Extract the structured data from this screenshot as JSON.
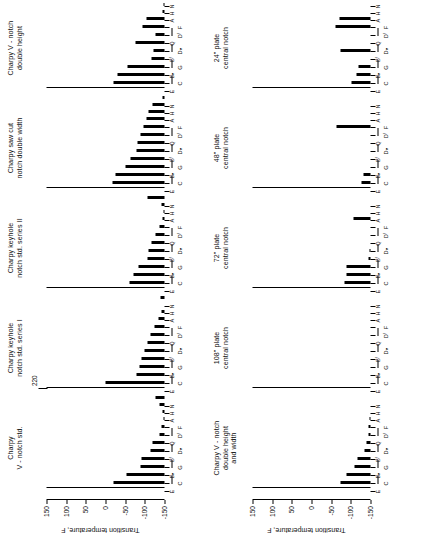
{
  "figure": {
    "orientation": "rotated-90-ccw",
    "axis_label": "Transition temperature, F",
    "y_ticks": [
      "150",
      "100",
      "50",
      "0",
      "-50",
      "-100",
      "-150"
    ],
    "y_tick_values": [
      150,
      100,
      50,
      0,
      -50,
      -100,
      -150
    ],
    "ylim": [
      -150,
      150
    ],
    "categories": [
      "E",
      "C",
      "Bₙ",
      "G",
      "Bᶠ",
      "Dₙ",
      "Q",
      "Dᶠ",
      "F",
      "A",
      "H",
      "N"
    ],
    "category_row1": [
      "E",
      "Bₙ",
      "Bᶠ",
      "Q"
    ],
    "category_row2": [
      "C",
      "G",
      "Dₙ",
      "Dᶠ",
      "F"
    ],
    "category_row3": [
      "A",
      "H",
      "N"
    ],
    "annotation": "220"
  },
  "chart_data": {
    "type": "bar",
    "xlabel": "",
    "ylabel": "Transition temperature, F",
    "ylim": [
      -150,
      150
    ],
    "grid": false,
    "legend": "none",
    "categories": [
      "E",
      "C",
      "Bₙ",
      "G",
      "Bᶠ",
      "Dₙ",
      "Q",
      "Dᶠ",
      "F",
      "A",
      "H",
      "N"
    ],
    "panels": [
      {
        "id": "charpy-v-notch-std",
        "title": "Charpy\nV - notch std.",
        "row": "top",
        "col": 0,
        "values": [
          130,
          96,
          60,
          58,
          36,
          30,
          12,
          8,
          2,
          -6,
          -14,
          -22
        ]
      },
      {
        "id": "charpy-keyhole-notch-std-series-i",
        "title": "Charpy keyhole\nnotch std. series I",
        "row": "top",
        "col": 1,
        "annotation": "220",
        "annotation_category": "E",
        "values": [
          150,
          72,
          64,
          58,
          50,
          44,
          36,
          26,
          16,
          8,
          0,
          -10
        ]
      },
      {
        "id": "charpy-keyhole-notch-std-series-ii",
        "title": "Charpy keyhole\nnotch std. series II",
        "row": "top",
        "col": 2,
        "values": [
          88,
          78,
          66,
          44,
          40,
          34,
          24,
          12,
          4,
          -2,
          -8,
          -44
        ]
      },
      {
        "id": "charpy-saw-cut-notch-double-width",
        "title": "Charpy saw cut\nnotch double width",
        "row": "top",
        "col": 3,
        "values": [
          132,
          124,
          100,
          86,
          72,
          68,
          60,
          54,
          46,
          40,
          30,
          -4
        ]
      },
      {
        "id": "charpy-v-notch-double-height",
        "title": "Charpy V - notch\ndouble height",
        "row": "top",
        "col": 4,
        "values": [
          130,
          120,
          94,
          34,
          28,
          74,
          22,
          56,
          46,
          4,
          2,
          0
        ]
      },
      {
        "id": "charpy-v-notch-double-height-and-width",
        "title": "Charpy V - notch\ndouble height\nand width",
        "row": "bottom",
        "col": 0,
        "values": [
          76,
          62,
          40,
          34,
          16,
          10,
          6,
          4,
          2,
          0,
          0,
          0
        ]
      },
      {
        "id": "plate-108-central-notch",
        "title": "108\" plate\ncentral notch",
        "row": "bottom",
        "col": 1,
        "values": [
          0,
          0,
          0,
          0,
          0,
          0,
          0,
          0,
          0,
          0,
          0,
          0
        ]
      },
      {
        "id": "plate-72-central-notch",
        "title": "72\" plate\ncentral notch",
        "row": "bottom",
        "col": 2,
        "values": [
          66,
          62,
          60,
          4,
          2,
          0,
          0,
          0,
          44,
          0,
          0,
          0
        ]
      },
      {
        "id": "plate-48-central-notch",
        "title": "48\" plate\ncentral notch",
        "row": "bottom",
        "col": 3,
        "values": [
          22,
          18,
          0,
          0,
          0,
          0,
          0,
          86,
          0,
          0,
          0,
          0
        ]
      },
      {
        "id": "plate-24-central-notch",
        "title": "24\" plate\ncentral notch",
        "row": "bottom",
        "col": 4,
        "values": [
          48,
          36,
          30,
          0,
          76,
          0,
          0,
          88,
          80,
          0,
          0,
          0
        ]
      }
    ]
  }
}
